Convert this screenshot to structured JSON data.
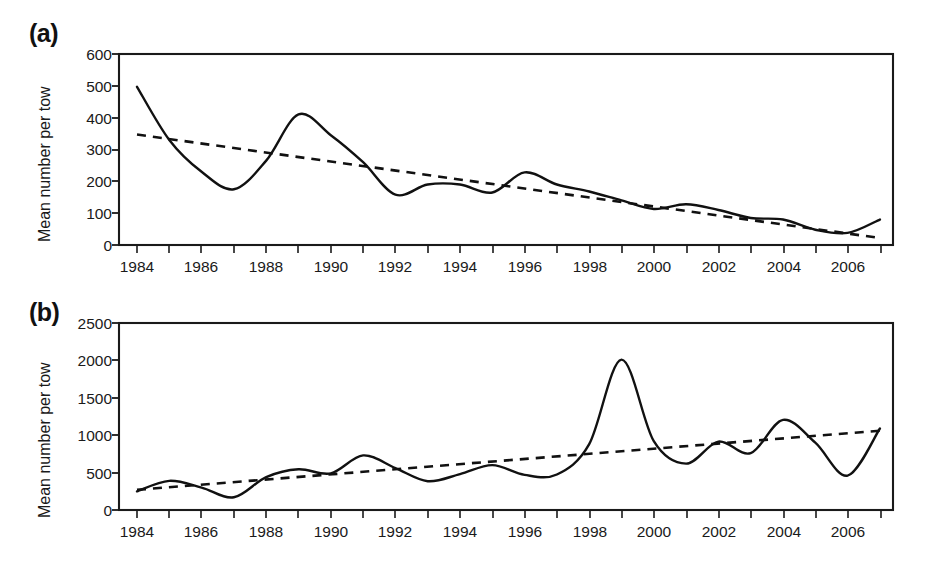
{
  "figure": {
    "background": "#ffffff",
    "ink_color": "#111111",
    "panels": [
      {
        "tag": "(a)",
        "y_axis_title": "Mean number per tow",
        "y_ticks": [
          "0",
          "100",
          "200",
          "300",
          "400",
          "500",
          "600"
        ],
        "x_ticks": [
          "1984",
          "1986",
          "1988",
          "1990",
          "1992",
          "1994",
          "1996",
          "1998",
          "2000",
          "2002",
          "2004",
          "2006"
        ]
      },
      {
        "tag": "(b)",
        "y_axis_title": "Mean number per tow",
        "y_ticks": [
          "0",
          "500",
          "1000",
          "1500",
          "2000",
          "2500"
        ],
        "x_ticks": [
          "1984",
          "1986",
          "1988",
          "1990",
          "1992",
          "1994",
          "1996",
          "1998",
          "2000",
          "2002",
          "2004",
          "2006"
        ]
      }
    ]
  },
  "chart_data": [
    {
      "type": "line",
      "title": "(a)",
      "xlabel": "",
      "ylabel": "Mean number per tow",
      "xlim": [
        1983.5,
        1983.5
      ],
      "ylim": [
        0,
        600
      ],
      "ytick_values": [
        0,
        100,
        200,
        300,
        400,
        500,
        600
      ],
      "xtick_values": [
        1984,
        1985,
        1986,
        1987,
        1988,
        1989,
        1990,
        1991,
        1992,
        1993,
        1994,
        1995,
        1996,
        1997,
        1998,
        1999,
        2000,
        2001,
        2002,
        2003,
        2004,
        2005,
        2006,
        2007
      ],
      "xtick_labels_shown": [
        1984,
        1986,
        1988,
        1990,
        1992,
        1994,
        1996,
        1998,
        2000,
        2002,
        2004,
        2006
      ],
      "grid": false,
      "legend": "none",
      "series": [
        {
          "name": "Mean number per tow (annual)",
          "style": "solid",
          "x": [
            1984,
            1985,
            1986,
            1987,
            1988,
            1989,
            1990,
            1991,
            1992,
            1993,
            1994,
            1995,
            1996,
            1997,
            1998,
            1999,
            2000,
            2001,
            2002,
            2003,
            2004,
            2005,
            2006,
            2007
          ],
          "values": [
            497,
            330,
            230,
            175,
            265,
            410,
            345,
            260,
            158,
            190,
            190,
            165,
            228,
            190,
            168,
            140,
            113,
            128,
            110,
            85,
            80,
            48,
            38,
            80
          ]
        },
        {
          "name": "Linear trend",
          "style": "dashed",
          "x": [
            1984,
            2007
          ],
          "values": [
            347,
            22
          ]
        }
      ]
    },
    {
      "type": "line",
      "title": "(b)",
      "xlabel": "",
      "ylabel": "Mean number per tow",
      "xlim": [
        1983.5,
        2007.3
      ],
      "ylim": [
        0,
        2500
      ],
      "ytick_values": [
        0,
        500,
        1000,
        1500,
        2000,
        2500
      ],
      "xtick_values": [
        1984,
        1985,
        1986,
        1987,
        1988,
        1989,
        1990,
        1991,
        1992,
        1993,
        1994,
        1995,
        1996,
        1997,
        1998,
        1999,
        2000,
        2001,
        2002,
        2003,
        2004,
        2005,
        2006,
        2007
      ],
      "xtick_labels_shown": [
        1984,
        1986,
        1988,
        1990,
        1992,
        1994,
        1996,
        1998,
        2000,
        2002,
        2004,
        2006
      ],
      "grid": false,
      "legend": "none",
      "series": [
        {
          "name": "Mean number per tow (annual)",
          "style": "solid",
          "x": [
            1984,
            1985,
            1986,
            1987,
            1988,
            1989,
            1990,
            1991,
            1992,
            1993,
            1994,
            1995,
            1996,
            1997,
            1998,
            1999,
            2000,
            2001,
            2002,
            2003,
            2004,
            2005,
            2006,
            2007
          ],
          "values": [
            250,
            390,
            300,
            170,
            440,
            545,
            490,
            730,
            560,
            385,
            480,
            600,
            470,
            475,
            880,
            2010,
            920,
            620,
            915,
            760,
            1205,
            900,
            460,
            1090
          ]
        },
        {
          "name": "Linear trend",
          "style": "dashed",
          "x": [
            1984,
            2007
          ],
          "values": [
            270,
            1060
          ]
        }
      ]
    }
  ]
}
